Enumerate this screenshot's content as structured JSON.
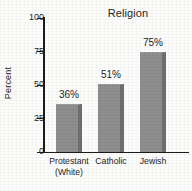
{
  "chart_data": {
    "type": "bar",
    "title": "Religion",
    "xlabel": "",
    "ylabel": "Percent",
    "categories": [
      "Protestant\n(White)",
      "Catholic",
      "Jewish"
    ],
    "category_lines": [
      [
        "Protestant",
        "(White)"
      ],
      [
        "Catholic"
      ],
      [
        "Jewish"
      ]
    ],
    "values": [
      36,
      51,
      75
    ],
    "data_labels": [
      "36%",
      "51%",
      "75%"
    ],
    "ylim": [
      0,
      100
    ],
    "yticks": [
      0,
      25,
      50,
      75,
      100
    ],
    "ytick_labels": [
      "0",
      "25",
      "50",
      "75",
      "100"
    ],
    "grid": false,
    "legend": false,
    "colors": {
      "bar_fill": "#8e8e8e",
      "bar_shadow": "#6f6f6f",
      "axis": "#1b1b1b",
      "text": "#1e1e1e",
      "background": "#fdfdfc"
    }
  }
}
